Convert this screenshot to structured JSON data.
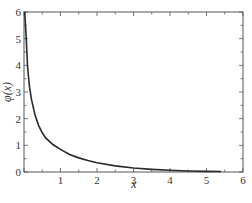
{
  "chart_data": {
    "type": "line",
    "title": "",
    "xlabel": "x",
    "ylabel": "φ(x)",
    "xlim": [
      0,
      6
    ],
    "ylim": [
      0,
      6
    ],
    "xticks": [
      0,
      1,
      2,
      3,
      4,
      5,
      6
    ],
    "xtick_labels": [
      "1",
      "2",
      "3",
      "4",
      "5",
      "6"
    ],
    "yticks": [
      0,
      1,
      2,
      3,
      4,
      5,
      6
    ],
    "ytick_labels": [
      "0",
      "1",
      "2",
      "3",
      "4",
      "5",
      "6"
    ],
    "grid": false,
    "legend": null,
    "series": [
      {
        "name": "φ(x)",
        "color": "#2a2a2a",
        "x": [
          0.02,
          0.05,
          0.1,
          0.15,
          0.2,
          0.3,
          0.4,
          0.5,
          0.6,
          0.8,
          1.0,
          1.25,
          1.5,
          1.75,
          2.0,
          2.5,
          3.0,
          3.5,
          4.0,
          4.5,
          5.0,
          5.4
        ],
        "y": [
          6.0,
          5.3,
          3.9,
          3.2,
          2.75,
          2.15,
          1.75,
          1.47,
          1.27,
          1.02,
          0.85,
          0.66,
          0.53,
          0.43,
          0.35,
          0.23,
          0.15,
          0.1,
          0.065,
          0.04,
          0.025,
          0.02
        ]
      }
    ]
  },
  "labels": {
    "xlabel": "x",
    "ylabel": "φ(x)",
    "x_tick_texts": [
      "1",
      "2",
      "3",
      "4",
      "5",
      "6"
    ],
    "y_tick_texts": [
      "0",
      "1",
      "2",
      "3",
      "4",
      "5",
      "6"
    ]
  }
}
